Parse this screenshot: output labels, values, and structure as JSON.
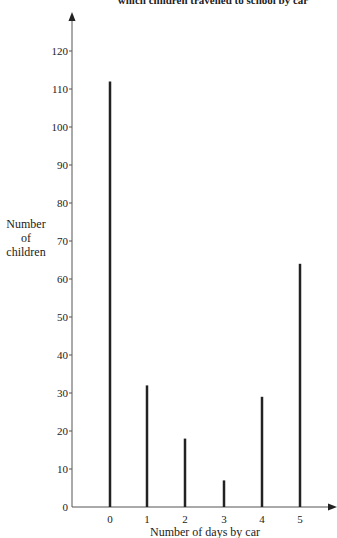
{
  "chart_data": {
    "type": "bar",
    "title": "which children travelled to school by car",
    "xlabel": "Number of days by car",
    "ylabel": [
      "Number",
      "of",
      "children"
    ],
    "categories": [
      "0",
      "1",
      "2",
      "3",
      "4",
      "5"
    ],
    "values": [
      112,
      32,
      18,
      7,
      29,
      64
    ],
    "yticks": [
      0,
      10,
      20,
      30,
      40,
      50,
      60,
      70,
      80,
      90,
      100,
      110,
      120
    ],
    "ylim": [
      0,
      125
    ],
    "grid": false,
    "legend": null,
    "style": "vertical line bars"
  }
}
